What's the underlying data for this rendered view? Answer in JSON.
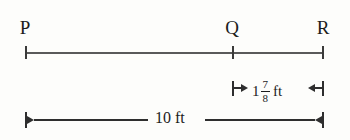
{
  "diagram": {
    "type": "line-segment-measurement",
    "points": [
      {
        "id": "p",
        "label": "P"
      },
      {
        "id": "q",
        "label": "Q"
      },
      {
        "id": "r",
        "label": "R"
      }
    ],
    "dimensions": [
      {
        "id": "short",
        "from": "Q",
        "to": "R",
        "whole": "1",
        "numerator": "7",
        "denominator": "8",
        "unit": "ft",
        "text": "1 7/8 ft"
      },
      {
        "id": "long",
        "from": "P",
        "to": "R",
        "value": "10 ft",
        "unit": "ft",
        "text": "10 ft"
      }
    ],
    "colors": {
      "background": "#fdfdfb",
      "segment": "#5a5a5a",
      "dimension": "#2e2e2e",
      "text": "#1c1c1c"
    }
  }
}
